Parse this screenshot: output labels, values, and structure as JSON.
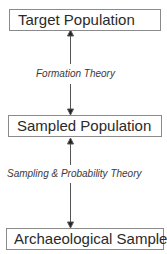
{
  "diagram": {
    "nodes": [
      {
        "id": "target",
        "label": "Target Population"
      },
      {
        "id": "sampled",
        "label": "Sampled Population"
      },
      {
        "id": "archaeological",
        "label": "Archaeological Sample"
      }
    ],
    "edges": [
      {
        "from": "target",
        "to": "sampled",
        "label": "Formation Theory",
        "direction": "bidirectional"
      },
      {
        "from": "sampled",
        "to": "archaeological",
        "label": "Sampling & Probability Theory",
        "direction": "bidirectional"
      }
    ]
  }
}
